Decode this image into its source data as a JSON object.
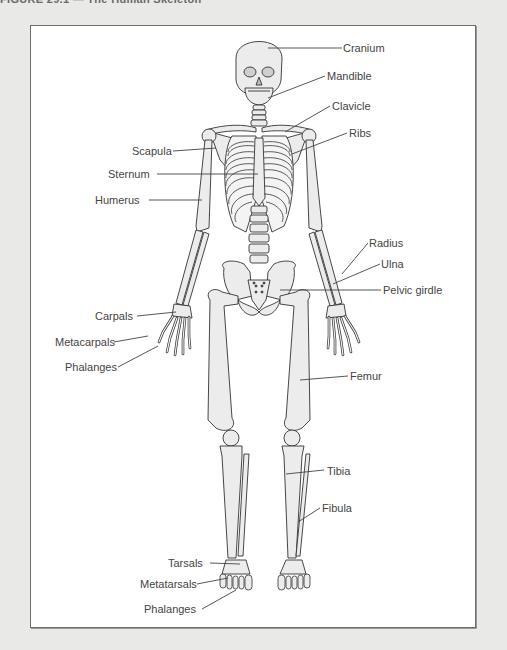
{
  "caption": "FIGURE 29.1 — The Human Skeleton",
  "diagram": {
    "title": "The Human Skeleton",
    "labels": [
      {
        "id": "cranium",
        "text": "Cranium",
        "x": 343,
        "y": 42
      },
      {
        "id": "mandible",
        "text": "Mandible",
        "x": 327,
        "y": 70
      },
      {
        "id": "clavicle",
        "text": "Clavicle",
        "x": 332,
        "y": 100
      },
      {
        "id": "ribs",
        "text": "Ribs",
        "x": 349,
        "y": 127
      },
      {
        "id": "scapula",
        "text": "Scapula",
        "x": 132,
        "y": 145
      },
      {
        "id": "sternum",
        "text": "Sternum",
        "x": 108,
        "y": 168
      },
      {
        "id": "humerus",
        "text": "Humerus",
        "x": 95,
        "y": 194
      },
      {
        "id": "radius",
        "text": "Radius",
        "x": 369,
        "y": 237
      },
      {
        "id": "ulna",
        "text": "Ulna",
        "x": 381,
        "y": 258
      },
      {
        "id": "pelvic-girdle",
        "text": "Pelvic girdle",
        "x": 383,
        "y": 284
      },
      {
        "id": "carpals",
        "text": "Carpals",
        "x": 95,
        "y": 310
      },
      {
        "id": "metacarpals",
        "text": "Metacarpals",
        "x": 55,
        "y": 336
      },
      {
        "id": "phalanges-hand",
        "text": "Phalanges",
        "x": 65,
        "y": 361
      },
      {
        "id": "femur",
        "text": "Femur",
        "x": 350,
        "y": 370
      },
      {
        "id": "tibia",
        "text": "Tibia",
        "x": 327,
        "y": 465
      },
      {
        "id": "fibula",
        "text": "Fibula",
        "x": 322,
        "y": 502
      },
      {
        "id": "tarsals",
        "text": "Tarsals",
        "x": 168,
        "y": 557
      },
      {
        "id": "metatarsals",
        "text": "Metatarsals",
        "x": 140,
        "y": 578
      },
      {
        "id": "phalanges-foot",
        "text": "Phalanges",
        "x": 144,
        "y": 603
      }
    ]
  },
  "colors": {
    "bone_fill": "#ececec",
    "bone_stroke": "#333333",
    "leader_line": "#444444",
    "frame_border": "#6e6e6e",
    "page_background": "#e9e9e8"
  }
}
